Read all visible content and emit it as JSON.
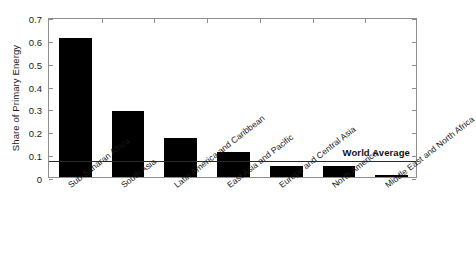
{
  "chart_data": {
    "type": "bar",
    "title": "",
    "xlabel": "",
    "ylabel": "Share of Primary Energy",
    "ylim": [
      0,
      0.7
    ],
    "yticks": [
      "0",
      "0.1",
      "0.2",
      "0.3",
      "0.4",
      "0.5",
      "0.6",
      "0.7"
    ],
    "ytick_values": [
      0,
      0.1,
      0.2,
      0.3,
      0.4,
      0.5,
      0.6,
      0.7
    ],
    "grid": false,
    "legend": "none",
    "bar_color": "#000000",
    "categories": [
      "Sub-Saharan Africa",
      "South Asia",
      "Latin America and Caribbean",
      "East Asia and Pacific",
      "Europe and Central Asia",
      "North America",
      "Middle East and North Africa"
    ],
    "values": [
      0.61,
      0.29,
      0.17,
      0.11,
      0.05,
      0.05,
      0.01
    ],
    "annotations": [
      {
        "name": "world-average",
        "label": "World Average",
        "value": 0.08,
        "type": "horizontal-line",
        "color": "#2b2b2b"
      }
    ]
  }
}
